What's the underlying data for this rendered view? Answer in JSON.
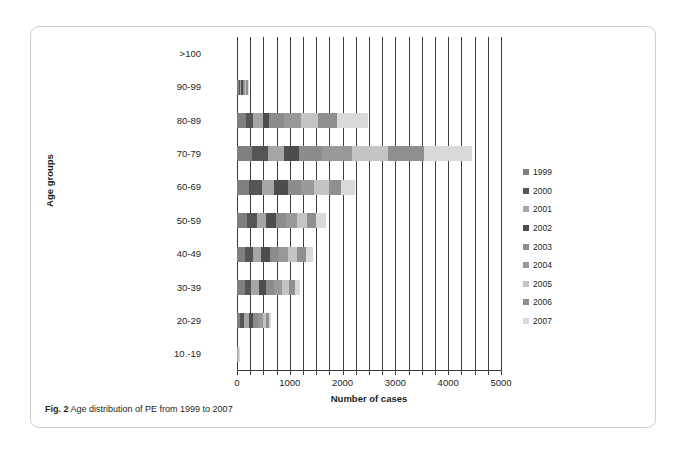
{
  "caption": {
    "label": "Fig. 2",
    "text": "Age distribution of PE from 1999 to 2007"
  },
  "chart_data": {
    "type": "bar",
    "orientation": "horizontal",
    "stacked": true,
    "title": "",
    "xlabel": "Number of cases",
    "ylabel": "Age groups",
    "xlim": [
      0,
      5000
    ],
    "xticks": [
      0,
      1000,
      2000,
      3000,
      4000,
      5000
    ],
    "xtick_labels": [
      "0",
      "1000",
      "2000",
      "3000",
      "4000",
      "5000"
    ],
    "minor_tick_step": 250,
    "grid": true,
    "grid_axis": "x",
    "legend_position": "right",
    "categories": [
      "10.-19",
      "20-29",
      "30-39",
      "40-49",
      "50-59",
      "60-69",
      "70-79",
      "80-89",
      "90-99",
      ">100"
    ],
    "categories_top_to_bottom": [
      ">100",
      "90-99",
      "80-89",
      "70-79",
      "60-69",
      "50-59",
      "40-49",
      "30-39",
      "20-29",
      "10.-19"
    ],
    "series": [
      {
        "name": "1999",
        "color": "#7f7f7f",
        "values": [
          5,
          60,
          150,
          160,
          190,
          230,
          290,
          170,
          30,
          0
        ]
      },
      {
        "name": "2000",
        "color": "#555555",
        "values": [
          4,
          70,
          120,
          150,
          180,
          240,
          300,
          130,
          25,
          0
        ]
      },
      {
        "name": "2001",
        "color": "#a6a6a6",
        "values": [
          5,
          90,
          150,
          150,
          170,
          240,
          300,
          200,
          30,
          0
        ]
      },
      {
        "name": "2002",
        "color": "#4d4d4d",
        "values": [
          4,
          80,
          130,
          160,
          190,
          250,
          290,
          110,
          20,
          0
        ]
      },
      {
        "name": "2003",
        "color": "#8c8c8c",
        "values": [
          5,
          100,
          160,
          170,
          200,
          250,
          430,
          290,
          30,
          0
        ]
      },
      {
        "name": "2004",
        "color": "#999999",
        "values": [
          5,
          90,
          150,
          180,
          200,
          250,
          560,
          320,
          25,
          0
        ]
      },
      {
        "name": "2005",
        "color": "#c4c4c4",
        "values": [
          5,
          60,
          130,
          170,
          190,
          280,
          700,
          320,
          20,
          0
        ]
      },
      {
        "name": "2006",
        "color": "#8f8f8f",
        "values": [
          4,
          50,
          110,
          160,
          180,
          230,
          670,
          360,
          20,
          0
        ]
      },
      {
        "name": "2007",
        "color": "#d9d9d9",
        "values": [
          5,
          40,
          100,
          140,
          180,
          260,
          910,
          580,
          35,
          0
        ]
      }
    ],
    "totals": [
      42,
      640,
      1200,
      1440,
      1680,
      2230,
      4450,
      2480,
      235,
      0
    ],
    "bar_pixel_scale_note": "0-5000 maps across plot width"
  },
  "legend": {
    "entries": [
      "1999",
      "2000",
      "2001",
      "2002",
      "2003",
      "2004",
      "2005",
      "2006",
      "2007"
    ]
  }
}
